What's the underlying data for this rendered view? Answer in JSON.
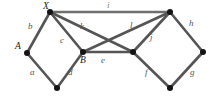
{
  "figure": {
    "name": "undirected-graph-diagram",
    "background_color": "#ffffff",
    "edge_color": "#6e6e6e",
    "vertex_color": "#141414",
    "label_color": "#2b2b2b"
  },
  "vertices": [
    {
      "id": "X",
      "label": "X",
      "x": 50,
      "y": 12,
      "label_x": 43,
      "label_y": 2
    },
    {
      "id": "T",
      "label": "",
      "x": 170,
      "y": 12,
      "label_x": 170,
      "label_y": 2
    },
    {
      "id": "A",
      "label": "A",
      "x": 27,
      "y": 53,
      "label_x": 15,
      "label_y": 42
    },
    {
      "id": "B",
      "label": "B",
      "x": 83,
      "y": 52,
      "label_x": 80,
      "label_y": 56
    },
    {
      "id": "R",
      "label": "",
      "x": 133,
      "y": 52,
      "label_x": 133,
      "label_y": 56
    },
    {
      "id": "E",
      "label": "",
      "x": 203,
      "y": 52,
      "label_x": 203,
      "label_y": 42
    },
    {
      "id": "BL",
      "label": "",
      "x": 57,
      "y": 88,
      "label_x": 57,
      "label_y": 92
    },
    {
      "id": "BR",
      "label": "",
      "x": 170,
      "y": 88,
      "label_x": 170,
      "label_y": 92
    }
  ],
  "edges": [
    {
      "id": "a",
      "label": "a",
      "from": "A",
      "to": "BL",
      "label_x": 30,
      "label_y": 68,
      "faint": false
    },
    {
      "id": "b",
      "label": "b",
      "from": "A",
      "to": "X",
      "label_x": 28,
      "label_y": 22,
      "faint": false
    },
    {
      "id": "c",
      "label": "c",
      "from": "X",
      "to": "B",
      "label_x": 60,
      "label_y": 36,
      "faint": false
    },
    {
      "id": "d",
      "label": "d",
      "from": "BL",
      "to": "B",
      "label_x": 68,
      "label_y": 68,
      "faint": false
    },
    {
      "id": "e",
      "label": "e",
      "from": "B",
      "to": "R",
      "label_x": 101,
      "label_y": 56,
      "faint": false
    },
    {
      "id": "f",
      "label": "f",
      "from": "R",
      "to": "BR",
      "label_x": 145,
      "label_y": 68,
      "faint": false
    },
    {
      "id": "g",
      "label": "g",
      "from": "BR",
      "to": "E",
      "label_x": 190,
      "label_y": 68,
      "faint": false
    },
    {
      "id": "h",
      "label": "h",
      "from": "T",
      "to": "E",
      "label_x": 189,
      "label_y": 19,
      "faint": false
    },
    {
      "id": "i",
      "label": "i",
      "from": "X",
      "to": "T",
      "label_x": 107,
      "label_y": 1,
      "faint": true
    },
    {
      "id": "j",
      "label": "j",
      "from": "T",
      "to": "R",
      "label_x": 150,
      "label_y": 33,
      "faint": false
    },
    {
      "id": "k",
      "label": "k",
      "from": "X",
      "to": "R",
      "label_x": 80,
      "label_y": 22,
      "faint": false
    },
    {
      "id": "l",
      "label": "l",
      "from": "T",
      "to": "B",
      "label_x": 130,
      "label_y": 21,
      "faint": false
    }
  ]
}
